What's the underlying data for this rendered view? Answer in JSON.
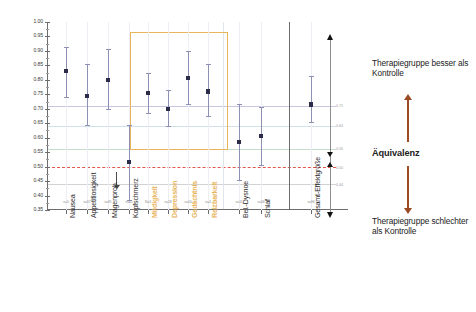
{
  "chart_data": {
    "type": "scatter",
    "title": "",
    "xlabel": "",
    "ylabel": "",
    "ylim": [
      0.35,
      1.0
    ],
    "ytick_labels": [
      "1.00",
      "0.95",
      "0.90",
      "0.85",
      "0.80",
      "0.75",
      "0.70",
      "0.65",
      "0.60",
      "0.55",
      "0.50",
      "0.45",
      "0.40",
      "0.35"
    ],
    "ytick_values": [
      1.0,
      0.95,
      0.9,
      0.85,
      0.8,
      0.75,
      0.7,
      0.65,
      0.6,
      0.55,
      0.5,
      0.45,
      0.4,
      0.35
    ],
    "grid": true,
    "legend_position": "right",
    "categories": [
      "Nausea",
      "Appetitlosigkeit",
      "Magenprob.",
      "Kopfschmerz",
      "Müdigkeit",
      "Depression",
      "Gedächtnis",
      "Reizbarkeit",
      "Bel.-Dysnoe",
      "Schlaf",
      "Gesamt-Effektgröße"
    ],
    "highlighted_categories": [
      "Müdigkeit",
      "Depression",
      "Gedächtnis",
      "Reizbarkeit"
    ],
    "series": [
      {
        "name": "Effektgröße mit Konfidenzintervall",
        "values": [
          0.83,
          0.745,
          0.8,
          0.515,
          0.755,
          0.7,
          0.805,
          0.76,
          0.585,
          0.605,
          0.715
        ],
        "ci_low": [
          0.74,
          0.645,
          0.7,
          0.385,
          0.685,
          0.64,
          0.715,
          0.675,
          0.455,
          0.505,
          0.655
        ],
        "ci_high": [
          0.915,
          0.855,
          0.905,
          0.645,
          0.825,
          0.765,
          0.9,
          0.855,
          0.715,
          0.705,
          0.815
        ]
      }
    ],
    "reference_lines": [
      {
        "value": 0.71,
        "color": "#c9c7e0",
        "style": "solid"
      },
      {
        "value": 0.64,
        "color": "#cfe0ea",
        "style": "solid"
      },
      {
        "value": 0.56,
        "color": "#c9ddcd",
        "style": "solid"
      },
      {
        "value": 0.5,
        "color": "#e2574c",
        "style": "dashed"
      },
      {
        "value": 0.44,
        "color": "#d2d2d2",
        "style": "solid"
      }
    ],
    "reference_line_labels": [
      "0.71",
      "0.64",
      "0.56",
      "0.50",
      "0.44"
    ],
    "highlight_box": {
      "from_category": "Müdigkeit",
      "to_category": "Reizbarkeit",
      "y_top": 0.965,
      "y_bottom": 0.6,
      "color": "#e8b55c"
    },
    "subtick_labels": [
      "n=5",
      "n=57",
      "n=91",
      "n=61",
      "N=3",
      "n=18",
      "n=14",
      "n=4",
      "n=11",
      "n=56",
      "n=96"
    ]
  },
  "legend": {
    "top_text": "Therapiegruppe besser als Kontrolle",
    "middle_text": "Äquivalenz",
    "bottom_text": "Therapiegruppe schlechter als Kontrolle",
    "arrow_color": "#9c4a23"
  },
  "axis": {
    "equivalence_values": [
      "0.71",
      "0.64",
      "0.56",
      "0.50",
      "0.44"
    ]
  }
}
